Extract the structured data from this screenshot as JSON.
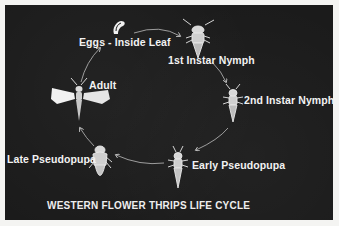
{
  "diagram": {
    "title": "WESTERN FLOWER THRIPS LIFE CYCLE",
    "stages": [
      {
        "id": "eggs",
        "label": "Eggs - Inside Leaf",
        "icon": "egg-icon"
      },
      {
        "id": "first-instar",
        "label": "1st Instar Nymph",
        "icon": "nymph-icon"
      },
      {
        "id": "second-instar",
        "label": "2nd Instar Nymph",
        "icon": "nymph-icon"
      },
      {
        "id": "early-pseudopupa",
        "label": "Early Pseudopupa",
        "icon": "pseudopupa-icon"
      },
      {
        "id": "late-pseudopupa",
        "label": "Late Pseudopupa",
        "icon": "pseudopupa-icon"
      },
      {
        "id": "adult",
        "label": "Adult",
        "icon": "winged-thrips-icon"
      }
    ],
    "flow": [
      "eggs",
      "first-instar",
      "second-instar",
      "early-pseudopupa",
      "late-pseudopupa",
      "adult",
      "eggs"
    ],
    "colors": {
      "background": "#1b1b1b",
      "border": "#f4f4f2",
      "foreground": "#f2f2f2"
    }
  }
}
